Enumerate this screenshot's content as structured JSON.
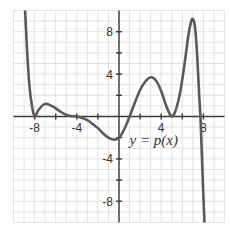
{
  "chart_data": {
    "type": "line",
    "title": "",
    "xlabel": "",
    "ylabel": "",
    "xlim": [
      -10,
      10
    ],
    "ylim": [
      -10,
      10
    ],
    "grid": true,
    "grid_step": 1,
    "tick_step": 2,
    "x_tick_labels": [
      {
        "value": -8,
        "label": "-8"
      },
      {
        "value": -4,
        "label": "-4"
      },
      {
        "value": 4,
        "label": "4"
      },
      {
        "value": 8,
        "label": "8"
      }
    ],
    "y_tick_labels": [
      {
        "value": 8,
        "label": "8"
      },
      {
        "value": 4,
        "label": "4"
      },
      {
        "value": -4,
        "label": "-4"
      },
      {
        "value": -8,
        "label": "-8"
      }
    ],
    "series": [
      {
        "name": "p(x)",
        "color": "#5a5a5a",
        "x": [
          -8.9,
          -8.7,
          -8.5,
          -8.25,
          -8.0,
          -7.7,
          -7.3,
          -6.9,
          -6.6,
          -6.2,
          -5.7,
          -5.2,
          -4.7,
          -4.3,
          -4.0,
          -3.6,
          -3.0,
          -2.5,
          -2.0,
          -1.5,
          -1.0,
          -0.5,
          0.0,
          0.5,
          1.0,
          1.5,
          2.0,
          2.5,
          3.0,
          3.5,
          4.0,
          4.4,
          4.8,
          5.0,
          5.3,
          5.7,
          6.0,
          6.3,
          6.6,
          6.85,
          7.0,
          7.15,
          7.3,
          7.45,
          7.6,
          7.72,
          7.85,
          8.0,
          8.1
        ],
        "y": [
          10.0,
          6.0,
          3.0,
          1.0,
          0.0,
          0.5,
          1.0,
          1.2,
          1.1,
          0.9,
          0.55,
          0.25,
          0.08,
          0.02,
          0.0,
          -0.1,
          -0.35,
          -0.7,
          -1.1,
          -1.6,
          -2.0,
          -2.2,
          -2.0,
          -1.2,
          0.0,
          1.3,
          2.5,
          3.3,
          3.7,
          3.4,
          2.4,
          1.2,
          0.25,
          0.0,
          0.4,
          1.8,
          3.5,
          5.6,
          7.8,
          9.0,
          9.2,
          8.8,
          7.4,
          5.0,
          2.0,
          0.0,
          -3.5,
          -7.5,
          -10.0
        ]
      }
    ],
    "annotations": [
      {
        "text": "y = p(x)",
        "x": 1.0,
        "y": -2.2
      }
    ]
  }
}
